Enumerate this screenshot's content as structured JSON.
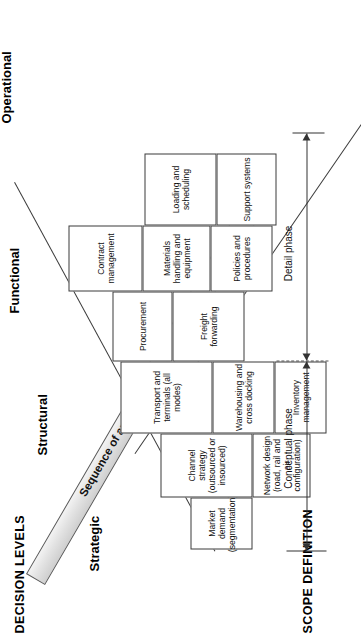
{
  "figure": {
    "type": "triangular-matrix-diagram",
    "orientation": "rotated-90-ccw",
    "axes": {
      "vertical_title": "DECISION LEVELS",
      "horizontal_title": "SCOPE DEFINITION"
    },
    "arrow": {
      "label": "Sequence of analysis",
      "fill_color": "#e2e2e2",
      "outline_color": "#5a5a5a",
      "direction": "up-right"
    },
    "decision_levels": [
      {
        "name": "Strategic"
      },
      {
        "name": "Structural"
      },
      {
        "name": "Functional"
      },
      {
        "name": "Operational"
      }
    ],
    "phases": [
      {
        "name": "Conceptual phase"
      },
      {
        "name": "Detail phase"
      }
    ],
    "cells": [
      {
        "row": 1,
        "col": 1,
        "label": "Market demand (segmentation)"
      },
      {
        "row": 2,
        "col": 1,
        "label": "Channel strategy (outsourced or insourced)"
      },
      {
        "row": 2,
        "col": 2,
        "label": "Network design (road, rail and air configuration)"
      },
      {
        "row": 3,
        "col": 1,
        "label": "Transport and terminals (all modes)"
      },
      {
        "row": 3,
        "col": 2,
        "label": "Warehousing and cross docking"
      },
      {
        "row": 3,
        "col": 3,
        "label": "Inventory management"
      },
      {
        "row": 4,
        "col": 1,
        "label": "Procurement"
      },
      {
        "row": 4,
        "col": 2,
        "label": "Freight forwarding"
      },
      {
        "row": 4,
        "col": 3,
        "label": "Contract management"
      },
      {
        "row": 4,
        "col": 4,
        "label": "Materials handling and equipment"
      },
      {
        "row": 4,
        "col": 5,
        "label": "Policies and procedures"
      },
      {
        "row": 4,
        "col": 6,
        "label": "Loading and scheduling"
      },
      {
        "row": 4,
        "col": 7,
        "label": "Support systems"
      }
    ]
  },
  "colors": {
    "line": "#3b3b3b",
    "arrow_fill": "#e2e2e2",
    "arrow_stroke": "#5a5a5a",
    "text": "#111111",
    "background": "#ffffff"
  }
}
